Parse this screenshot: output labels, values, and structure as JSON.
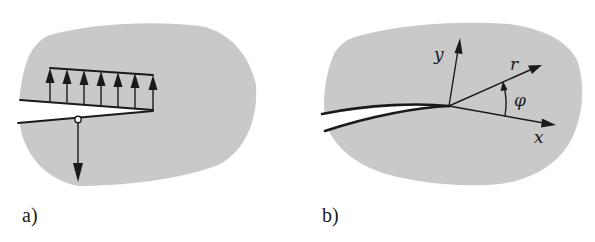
{
  "figure": {
    "panels": [
      {
        "id": "a",
        "label": "a)",
        "description": "Crack in body loaded by distributed traction on crack face and point force",
        "load_arrow_count": 7
      },
      {
        "id": "b",
        "label": "b)",
        "description": "Crack tip coordinate system",
        "axes": {
          "x_label": "x",
          "y_label": "y",
          "r_label": "r",
          "angle_label": "φ"
        }
      }
    ],
    "colors": {
      "body_fill": "#c9c9c9",
      "ink": "#1a1a1a",
      "background": "#ffffff"
    }
  }
}
